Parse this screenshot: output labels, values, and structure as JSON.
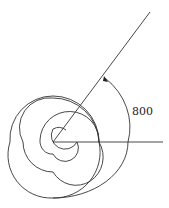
{
  "diagram": {
    "angle_label": "800",
    "angle_degrees": 800,
    "stroke_color": "#333333",
    "background": "#ffffff",
    "elements": [
      {
        "name": "initial-side",
        "type": "ray",
        "direction": "positive x-axis"
      },
      {
        "name": "terminal-side",
        "type": "ray",
        "direction": "80 degrees"
      },
      {
        "name": "rotation-spiral",
        "type": "spiral-arrow",
        "turns": "2 full turns + 80 degrees",
        "direction": "counterclockwise"
      }
    ]
  }
}
